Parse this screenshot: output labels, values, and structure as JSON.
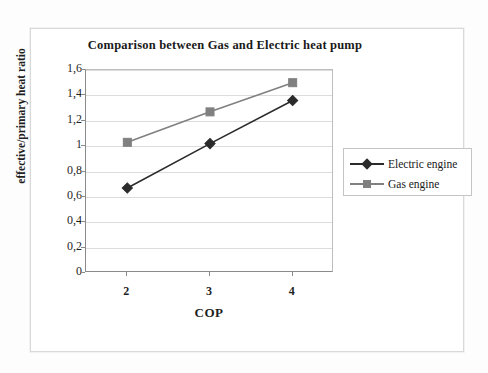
{
  "chart_data": {
    "type": "line",
    "title": "Comparison between Gas and Electric heat pump",
    "xlabel": "COP",
    "ylabel": "effective/primary heat ratio",
    "x": [
      2,
      3,
      4
    ],
    "categories": [
      "2",
      "3",
      "4"
    ],
    "xtick_labels": [
      "2",
      "3",
      "4"
    ],
    "ytick_labels": [
      "1,6",
      "1,4",
      "1,2",
      "1",
      "0,8",
      "0,6",
      "0,4",
      "0,2",
      "0"
    ],
    "ytick_values": [
      1.6,
      1.4,
      1.2,
      1.0,
      0.8,
      0.6,
      0.4,
      0.2,
      0
    ],
    "ylim": [
      0,
      1.6
    ],
    "xlim": [
      1.5,
      4.5
    ],
    "grid": "horizontal",
    "legend_position": "right",
    "series": [
      {
        "name": "Electric engine",
        "marker": "diamond",
        "color": "#2b2b2b",
        "values": [
          0.67,
          1.02,
          1.36
        ]
      },
      {
        "name": "Gas engine",
        "marker": "square",
        "color": "#808080",
        "values": [
          1.03,
          1.27,
          1.5
        ]
      }
    ]
  },
  "legend": {
    "items": [
      {
        "label": "Electric engine"
      },
      {
        "label": "Gas engine"
      }
    ]
  },
  "colors": {
    "electric": "#2b2b2b",
    "gas": "#808080",
    "gridline": "#dcdcdc",
    "axis": "#8a8a8a",
    "text": "#1f1f1f",
    "background": "#ffffff"
  }
}
